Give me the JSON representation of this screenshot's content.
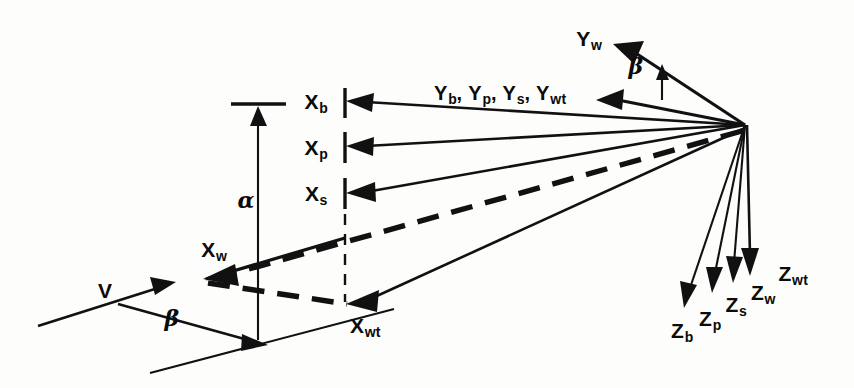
{
  "figure": {
    "type": "technical-line-diagram",
    "background_color": "#fdfdfc",
    "ink_color": "#111111"
  },
  "labels": {
    "x_body": {
      "base": "X",
      "sub": "b"
    },
    "x_principal": {
      "base": "X",
      "sub": "p"
    },
    "x_stability": {
      "base": "X",
      "sub": "s"
    },
    "x_wind": {
      "base": "X",
      "sub": "w"
    },
    "x_wind_tunnel": {
      "base": "X",
      "sub": "wt"
    },
    "y_group": "Y₀, Yₚ, Yₛ, Yᵥ",
    "y_group_parts": [
      {
        "base": "Y",
        "sub": "b",
        "sep": ","
      },
      {
        "base": "Y",
        "sub": "p",
        "sep": ","
      },
      {
        "base": "Y",
        "sub": "s",
        "sep": ","
      },
      {
        "base": "Y",
        "sub": "wt",
        "sep": ""
      }
    ],
    "y_wind": {
      "base": "Y",
      "sub": "w"
    },
    "z_body": {
      "base": "Z",
      "sub": "b"
    },
    "z_principal": {
      "base": "Z",
      "sub": "p"
    },
    "z_stability": {
      "base": "Z",
      "sub": "s"
    },
    "z_wind": {
      "base": "Z",
      "sub": "w"
    },
    "z_wind_tunnel": {
      "base": "Z",
      "sub": "wt"
    },
    "velocity": "V",
    "alpha": "α",
    "beta_upper": "β",
    "beta_lower": "β"
  },
  "geometry": {
    "origin": {
      "x": 745,
      "y": 125
    },
    "axis_pole_x": 345,
    "x_tick_rows": [
      {
        "name": "x_body",
        "y": 100
      },
      {
        "name": "x_principal",
        "y": 145
      },
      {
        "name": "x_stability",
        "y": 192
      }
    ],
    "x_wind_arrow_tip": {
      "x": 205,
      "y": 279
    },
    "x_wind_tunnel_tip": {
      "x": 347,
      "y": 303
    },
    "alpha_line_x": 258,
    "alpha_top_y": 104,
    "alpha_bottom_y": 340,
    "velocity_arrow": {
      "x1": 38,
      "y1": 326,
      "x2": 172,
      "y2": 285
    },
    "beta_arrow": {
      "x1": 120,
      "y1": 305,
      "x2": 264,
      "y2": 344
    },
    "ground_line": {
      "x1": 152,
      "y1": 372,
      "x2": 392,
      "y2": 310
    },
    "y_wind_arrow_tip": {
      "x": 614,
      "y": 45
    },
    "y_group_arrow_tip": {
      "x": 598,
      "y": 100
    },
    "z_arrow_tips": [
      {
        "name": "z_body",
        "x": 686,
        "y": 302
      },
      {
        "name": "z_principal",
        "x": 713,
        "y": 287
      },
      {
        "name": "z_stability",
        "x": 733,
        "y": 277
      },
      {
        "name": "z_wind",
        "x": 750,
        "y": 268
      }
    ]
  },
  "label_positions": {
    "x_body": {
      "x": 316,
      "y": 101
    },
    "x_principal": {
      "x": 316,
      "y": 147
    },
    "x_stability": {
      "x": 316,
      "y": 193
    },
    "x_wind": {
      "x": 214,
      "y": 249
    },
    "x_wind_tunnel": {
      "x": 365,
      "y": 325
    },
    "y_group": {
      "x": 500,
      "y": 93
    },
    "y_wind": {
      "x": 589,
      "y": 38
    },
    "z_body": {
      "x": 682,
      "y": 330
    },
    "z_principal": {
      "x": 710,
      "y": 318
    },
    "z_stability": {
      "x": 736,
      "y": 304
    },
    "z_wind": {
      "x": 763,
      "y": 292
    },
    "z_wind_tunnel": {
      "x": 793,
      "y": 273
    },
    "velocity": {
      "x": 105,
      "y": 290
    },
    "alpha": {
      "x": 246,
      "y": 200
    },
    "beta_upper": {
      "x": 636,
      "y": 66
    },
    "beta_lower": {
      "x": 172,
      "y": 318
    }
  }
}
